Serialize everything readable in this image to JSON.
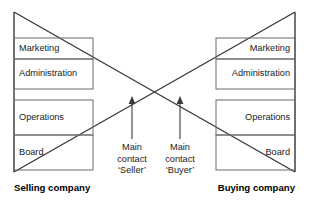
{
  "diagram": {
    "title_left": "Selling company",
    "title_right": "Buying company",
    "left_org": {
      "levels": [
        {
          "label": "Marketing"
        },
        {
          "label": "Administration"
        },
        {
          "label": "Operations"
        },
        {
          "label": "Board"
        }
      ]
    },
    "right_org": {
      "levels": [
        {
          "label": "Marketing"
        },
        {
          "label": "Administration"
        },
        {
          "label": "Operations"
        },
        {
          "label": "Board"
        }
      ]
    },
    "annotations": {
      "left_contact": {
        "line1": "Main",
        "line2": "contact",
        "line3": "‘Seller’"
      },
      "right_contact": {
        "line1": "Main",
        "line2": "contact",
        "line3": "‘Buyer’"
      }
    },
    "colors": {
      "stroke": "#3a3a3a",
      "box_stroke": "#6b6b6b",
      "text": "#1a1a1a",
      "background": "#ffffff"
    }
  }
}
